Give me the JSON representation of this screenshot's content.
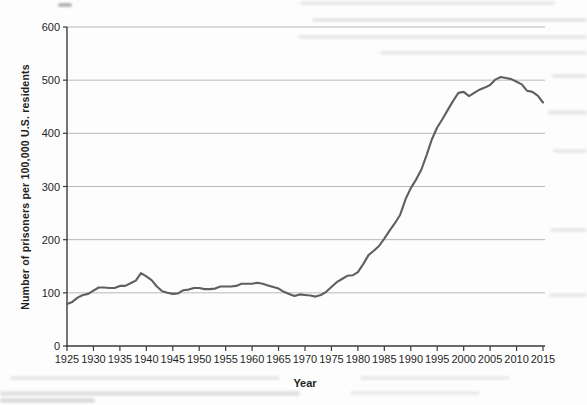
{
  "figure": {
    "colors": {
      "line": "#5f5f5f",
      "grid": "#b8b8b8",
      "axis": "#3a3a3a",
      "text": "#1f1f1f",
      "background": "#fdfdfd"
    }
  },
  "chart_data": {
    "type": "line",
    "title": "",
    "xlabel": "Year",
    "ylabel": "Number of prisoners per 100,000 U.S. residents",
    "xlim": [
      1925,
      2015
    ],
    "ylim": [
      0,
      600
    ],
    "xticks": [
      1925,
      1930,
      1935,
      1940,
      1945,
      1950,
      1955,
      1960,
      1965,
      1970,
      1975,
      1980,
      1985,
      1990,
      1995,
      2000,
      2005,
      2010,
      2015
    ],
    "yticks": [
      0,
      100,
      200,
      300,
      400,
      500,
      600
    ],
    "grid": "horizontal",
    "legend": "none",
    "series": [
      {
        "name": "prisoners-per-100000-us-residents",
        "x": [
          1925,
          1926,
          1927,
          1928,
          1929,
          1930,
          1931,
          1932,
          1933,
          1934,
          1935,
          1936,
          1937,
          1938,
          1939,
          1940,
          1941,
          1942,
          1943,
          1944,
          1945,
          1946,
          1947,
          1948,
          1949,
          1950,
          1951,
          1952,
          1953,
          1954,
          1955,
          1956,
          1957,
          1958,
          1959,
          1960,
          1961,
          1962,
          1963,
          1964,
          1965,
          1966,
          1967,
          1968,
          1969,
          1970,
          1971,
          1972,
          1973,
          1974,
          1975,
          1976,
          1977,
          1978,
          1979,
          1980,
          1981,
          1982,
          1983,
          1984,
          1985,
          1986,
          1987,
          1988,
          1989,
          1990,
          1991,
          1992,
          1993,
          1994,
          1995,
          1996,
          1997,
          1998,
          1999,
          2000,
          2001,
          2002,
          2003,
          2004,
          2005,
          2006,
          2007,
          2008,
          2009,
          2010,
          2011,
          2012,
          2013,
          2014,
          2015
        ],
        "values": [
          79,
          83,
          91,
          96,
          98,
          104,
          110,
          110,
          109,
          109,
          113,
          113,
          118,
          123,
          137,
          131,
          124,
          112,
          103,
          100,
          98,
          99,
          105,
          106,
          109,
          109,
          107,
          107,
          108,
          112,
          112,
          112,
          113,
          117,
          117,
          117,
          119,
          117,
          114,
          111,
          108,
          102,
          98,
          94,
          97,
          96,
          95,
          93,
          96,
          102,
          111,
          120,
          126,
          132,
          133,
          139,
          154,
          171,
          179,
          188,
          202,
          217,
          231,
          247,
          276,
          297,
          313,
          332,
          359,
          389,
          411,
          427,
          444,
          461,
          476,
          478,
          470,
          476,
          482,
          486,
          491,
          501,
          506,
          504,
          502,
          497,
          492,
          480,
          478,
          471,
          458
        ]
      }
    ]
  }
}
